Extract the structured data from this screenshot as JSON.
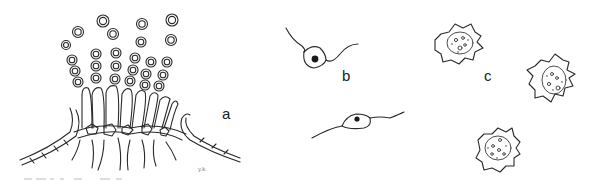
{
  "figure": {
    "panels": [
      {
        "id": "a",
        "label": "a",
        "description": "Sporulating structure: chains of spherical spores atop club-shaped cells on a layered base"
      },
      {
        "id": "b",
        "label": "b",
        "description": "Two flagellated cells with nucleus"
      },
      {
        "id": "c",
        "label": "c",
        "description": "Three irregular amoeboid cells with granular interior"
      }
    ],
    "signature": "y.k.",
    "colors": {
      "ink": "#2a2a2a",
      "background": "#ffffff"
    }
  }
}
